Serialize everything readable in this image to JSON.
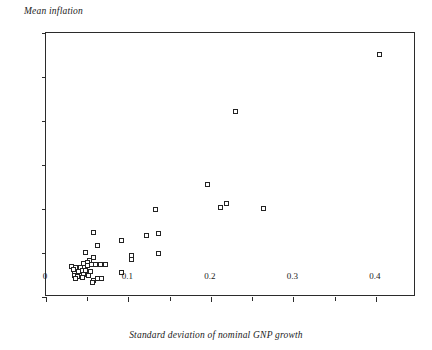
{
  "chart_data": {
    "type": "scatter",
    "title": "",
    "xlabel": "Standard deviation of nominal GNP growth",
    "ylabel": "Mean inflation",
    "xlim": [
      0,
      0.4485
    ],
    "ylim": [
      0,
      0.6
    ],
    "grid": false,
    "legend": null,
    "xticks": [
      0,
      0.1,
      0.2,
      0.3,
      0.4
    ],
    "xtick_labels": [
      "0",
      "0.1",
      "0.2",
      "0.3",
      "0.4"
    ],
    "xminor_ticks": [
      0.05,
      0.15,
      0.25,
      0.35
    ],
    "yticks": [
      0,
      0.1,
      0.2,
      0.3,
      0.4,
      0.5,
      0.6
    ],
    "ytick_labels": [
      "0",
      "0.1",
      "0.2",
      "0.3",
      "0.4",
      "0.5",
      "0.6"
    ],
    "marker": "open-square",
    "marker_color": "#232323",
    "marker_fill": "#ffffff",
    "points": [
      {
        "x": 0.404,
        "y": 0.552
      },
      {
        "x": 0.23,
        "y": 0.422
      },
      {
        "x": 0.196,
        "y": 0.255
      },
      {
        "x": 0.219,
        "y": 0.212
      },
      {
        "x": 0.211,
        "y": 0.203
      },
      {
        "x": 0.264,
        "y": 0.201
      },
      {
        "x": 0.133,
        "y": 0.199
      },
      {
        "x": 0.136,
        "y": 0.145
      },
      {
        "x": 0.122,
        "y": 0.14
      },
      {
        "x": 0.058,
        "y": 0.147
      },
      {
        "x": 0.092,
        "y": 0.128
      },
      {
        "x": 0.062,
        "y": 0.117
      },
      {
        "x": 0.136,
        "y": 0.099
      },
      {
        "x": 0.048,
        "y": 0.102
      },
      {
        "x": 0.104,
        "y": 0.095
      },
      {
        "x": 0.104,
        "y": 0.086
      },
      {
        "x": 0.057,
        "y": 0.09
      },
      {
        "x": 0.053,
        "y": 0.083
      },
      {
        "x": 0.05,
        "y": 0.078
      },
      {
        "x": 0.046,
        "y": 0.076
      },
      {
        "x": 0.05,
        "y": 0.072
      },
      {
        "x": 0.055,
        "y": 0.073
      },
      {
        "x": 0.06,
        "y": 0.075
      },
      {
        "x": 0.072,
        "y": 0.075
      },
      {
        "x": 0.066,
        "y": 0.073
      },
      {
        "x": 0.031,
        "y": 0.069
      },
      {
        "x": 0.036,
        "y": 0.068
      },
      {
        "x": 0.042,
        "y": 0.067
      },
      {
        "x": 0.033,
        "y": 0.063
      },
      {
        "x": 0.044,
        "y": 0.06
      },
      {
        "x": 0.048,
        "y": 0.061
      },
      {
        "x": 0.054,
        "y": 0.059
      },
      {
        "x": 0.04,
        "y": 0.057
      },
      {
        "x": 0.035,
        "y": 0.053
      },
      {
        "x": 0.046,
        "y": 0.052
      },
      {
        "x": 0.052,
        "y": 0.05
      },
      {
        "x": 0.092,
        "y": 0.056
      },
      {
        "x": 0.034,
        "y": 0.048
      },
      {
        "x": 0.038,
        "y": 0.046
      },
      {
        "x": 0.044,
        "y": 0.044
      },
      {
        "x": 0.036,
        "y": 0.043
      },
      {
        "x": 0.062,
        "y": 0.042
      },
      {
        "x": 0.067,
        "y": 0.041
      },
      {
        "x": 0.057,
        "y": 0.038
      },
      {
        "x": 0.056,
        "y": 0.032
      }
    ]
  }
}
